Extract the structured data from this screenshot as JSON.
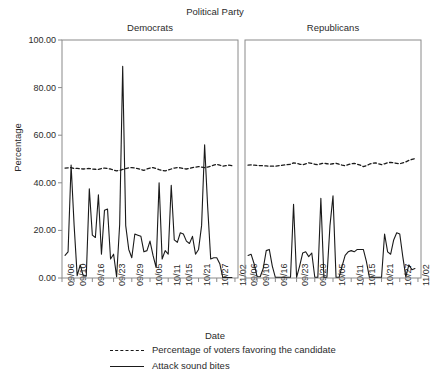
{
  "chart_data": {
    "type": "line",
    "title": "Political Party",
    "xlabel": "Date",
    "ylabel": "Percentage",
    "ylim": [
      0,
      100
    ],
    "yticks": [
      "0.00",
      "20.00",
      "40.00",
      "60.00",
      "80.00",
      "100.00"
    ],
    "ytick_values": [
      0,
      20,
      40,
      60,
      80,
      100
    ],
    "grid": false,
    "legend_position": "below",
    "legend": [
      {
        "label": "Percentage of voters favoring the candidate",
        "style": "dashed"
      },
      {
        "label": "Attack sound bites",
        "style": "solid"
      }
    ],
    "xtick_labels": [
      "09/06",
      "09/10",
      "09/16",
      "09/23",
      "09/29",
      "10/05",
      "10/11",
      "10/15",
      "10/21",
      "10/27",
      "11/02"
    ],
    "xtick_positions": [
      0,
      4,
      10,
      17,
      23,
      29,
      35,
      39,
      45,
      51,
      57
    ],
    "x_range": [
      0,
      58
    ],
    "panels": [
      {
        "name": "Democrats",
        "series": [
          {
            "name": "Percentage of voters favoring the candidate",
            "style": "dashed",
            "x": [
              1,
              2,
              3,
              4,
              5,
              6,
              7,
              8,
              9,
              10,
              11,
              12,
              13,
              14,
              15,
              16,
              17,
              18,
              19,
              20,
              21,
              22,
              23,
              24,
              25,
              26,
              27,
              28,
              29,
              30,
              31,
              32,
              33,
              34,
              35,
              36,
              37,
              38,
              39,
              40,
              41,
              42,
              43,
              44,
              45,
              46,
              47,
              48,
              49,
              50,
              51,
              52,
              53,
              54,
              55,
              56
            ],
            "values": [
              46.2,
              46.3,
              46.4,
              46.0,
              46.1,
              45.9,
              45.8,
              45.9,
              46.0,
              45.8,
              45.7,
              45.6,
              46.0,
              46.2,
              46.0,
              45.8,
              45.3,
              45.0,
              45.2,
              45.6,
              46.0,
              46.3,
              46.4,
              46.2,
              46.0,
              45.6,
              45.2,
              45.8,
              46.2,
              46.4,
              46.0,
              45.5,
              45.2,
              45.0,
              45.4,
              45.8,
              46.2,
              46.4,
              46.3,
              46.0,
              45.8,
              46.0,
              46.4,
              46.6,
              46.8,
              46.6,
              46.4,
              46.6,
              47.0,
              47.4,
              47.8,
              47.4,
              47.0,
              47.2,
              47.4,
              47.2
            ]
          },
          {
            "name": "Attack sound bites",
            "style": "solid",
            "x": [
              1,
              2,
              3,
              4,
              5,
              6,
              7,
              8,
              9,
              10,
              11,
              12,
              13,
              14,
              15,
              16,
              17,
              18,
              19,
              20,
              21,
              22,
              23,
              24,
              25,
              26,
              27,
              28,
              29,
              30,
              31,
              32,
              33,
              34,
              35,
              36,
              37,
              38,
              39,
              40,
              41,
              42,
              43,
              44,
              45,
              46,
              47,
              48,
              49,
              50,
              51,
              52,
              53,
              54,
              55,
              56
            ],
            "values": [
              9.5,
              11.0,
              47.5,
              22.0,
              1.0,
              5.5,
              1.0,
              0.8,
              37.5,
              18.0,
              17.0,
              35.0,
              10.0,
              28.5,
              29.0,
              8.0,
              10.0,
              0.5,
              22.5,
              89.0,
              22.0,
              12.0,
              8.5,
              18.5,
              18.0,
              17.5,
              11.0,
              11.5,
              15.5,
              9.5,
              4.5,
              40.0,
              8.0,
              11.5,
              10.0,
              39.0,
              16.0,
              15.0,
              19.0,
              18.5,
              15.5,
              14.5,
              17.5,
              10.0,
              12.0,
              22.0,
              56.0,
              30.0,
              8.0,
              8.5,
              8.5,
              6.0,
              0.2,
              0.2,
              0.2,
              0.2
            ]
          }
        ]
      },
      {
        "name": "Republicans",
        "series": [
          {
            "name": "Percentage of voters favoring the candidate",
            "style": "dashed",
            "x": [
              1,
              2,
              3,
              4,
              5,
              6,
              7,
              8,
              9,
              10,
              15,
              16,
              17,
              18,
              19,
              20,
              21,
              22,
              23,
              24,
              25,
              26,
              27,
              28,
              29,
              30,
              31,
              32,
              33,
              34,
              35,
              36,
              37,
              38,
              39,
              40,
              41,
              42,
              43,
              44,
              45,
              46,
              47,
              48,
              49,
              50,
              51,
              52,
              53,
              54,
              55,
              56
            ],
            "values": [
              47.4,
              47.5,
              47.4,
              47.3,
              47.2,
              47.2,
              47.1,
              47.0,
              47.0,
              47.0,
              47.8,
              48.4,
              48.2,
              47.8,
              47.6,
              48.0,
              48.4,
              48.2,
              47.8,
              47.6,
              48.0,
              48.2,
              48.0,
              47.8,
              48.0,
              48.2,
              47.8,
              47.4,
              47.2,
              47.6,
              48.0,
              48.2,
              47.8,
              47.4,
              46.8,
              47.2,
              47.8,
              48.2,
              48.4,
              48.0,
              47.6,
              48.0,
              48.4,
              48.6,
              48.4,
              48.2,
              48.0,
              48.4,
              48.8,
              49.4,
              49.8,
              50.2
            ]
          },
          {
            "name": "Attack sound bites",
            "style": "solid",
            "x": [
              1,
              2,
              3,
              4,
              5,
              6,
              7,
              8,
              9,
              10,
              15,
              16,
              17,
              18,
              19,
              20,
              21,
              22,
              23,
              24,
              25,
              26,
              27,
              28,
              29,
              30,
              31,
              32,
              33,
              34,
              35,
              36,
              37,
              38,
              39,
              40,
              41,
              42,
              43,
              44,
              45,
              46,
              47,
              48,
              49,
              50,
              51,
              52,
              53,
              54,
              55,
              56
            ],
            "values": [
              9.5,
              10.0,
              6.0,
              0.5,
              0.5,
              4.0,
              11.5,
              12.0,
              5.0,
              0.3,
              0.3,
              31.0,
              0.3,
              5.0,
              10.5,
              11.0,
              9.0,
              10.5,
              0.3,
              0.3,
              33.5,
              0.3,
              0.3,
              22.0,
              34.5,
              0.3,
              0.3,
              5.0,
              9.5,
              11.0,
              11.5,
              11.0,
              12.0,
              12.0,
              12.0,
              7.0,
              0.3,
              0.3,
              0.3,
              0.3,
              0.3,
              18.5,
              11.0,
              10.0,
              16.0,
              19.0,
              18.5,
              9.0,
              0.5,
              5.5,
              3.5,
              4.0
            ]
          }
        ]
      }
    ]
  },
  "colors": {
    "line": "#1a1a1a",
    "axis": "#8a8a8a",
    "text": "#2b2b2b",
    "background": "#ffffff"
  }
}
